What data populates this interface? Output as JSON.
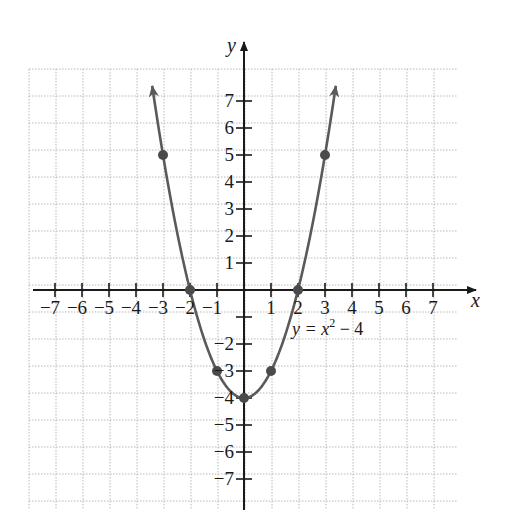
{
  "chart_data": {
    "type": "line",
    "title": "",
    "equation_label": {
      "prefix": "y = x",
      "exponent": "2",
      "suffix": " − 4"
    },
    "xlabel": "x",
    "ylabel": "y",
    "xlim": [
      -7.5,
      8.5
    ],
    "ylim": [
      -7.9,
      8.4
    ],
    "grid": true,
    "grid_style": "dotted",
    "x_ticks": [
      -7,
      -6,
      -5,
      -4,
      -3,
      -2,
      -1,
      1,
      2,
      3,
      4,
      5,
      6,
      7
    ],
    "y_ticks": [
      -7,
      -6,
      -5,
      -4,
      -3,
      -2,
      -1,
      1,
      2,
      3,
      4,
      5,
      6,
      7
    ],
    "x_tick_labels": [
      "−7",
      "−6",
      "−5",
      "−4",
      "−3",
      "−2",
      "−1",
      "1",
      "2",
      "3",
      "4",
      "5",
      "6",
      "7"
    ],
    "y_tick_labels": [
      "−7",
      "−6",
      "−5",
      "−4",
      "−3",
      "−2",
      "",
      "1",
      "2",
      "3",
      "4",
      "5",
      "6",
      "7"
    ],
    "series": [
      {
        "name": "y = x^2 - 4",
        "function": "x^2 - 4",
        "x_range": [
          -3.4,
          3.4
        ],
        "arrows_at_ends": true,
        "color": "#5a5a5a"
      }
    ],
    "points": [
      {
        "x": -3,
        "y": 5
      },
      {
        "x": -2,
        "y": 0
      },
      {
        "x": -1,
        "y": -3
      },
      {
        "x": 0,
        "y": -4
      },
      {
        "x": 1,
        "y": -3
      },
      {
        "x": 2,
        "y": 0
      },
      {
        "x": 3,
        "y": 5
      }
    ],
    "colors": {
      "axis": "#1a1a1a",
      "curve": "#5a5a5a",
      "grid": "#b8b8b8",
      "point": "#4a4a4a"
    }
  }
}
